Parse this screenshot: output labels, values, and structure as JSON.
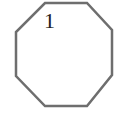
{
  "diagram": {
    "shape": "octagon",
    "label": "1",
    "stroke_color": "#6e6e6e",
    "fill_color": "#ffffff",
    "vertices": [
      [
        45,
        3
      ],
      [
        87,
        3
      ],
      [
        112,
        30
      ],
      [
        112,
        75
      ],
      [
        87,
        106
      ],
      [
        45,
        106
      ],
      [
        16,
        76
      ],
      [
        16,
        32
      ]
    ]
  }
}
